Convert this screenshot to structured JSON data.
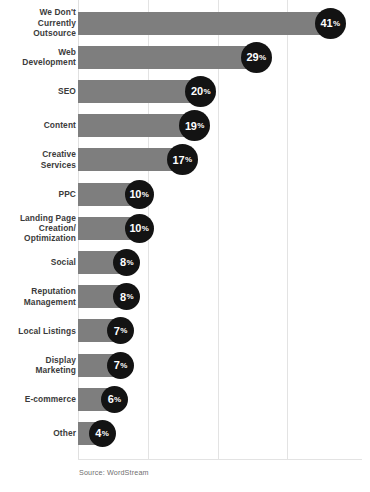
{
  "chart_data": {
    "type": "bar",
    "orientation": "horizontal",
    "title": "",
    "subtitle": "",
    "xlabel": "",
    "ylabel": "",
    "xlim": [
      0,
      45
    ],
    "grid": true,
    "gridline_values": [
      10,
      20,
      30
    ],
    "legend": "none",
    "value_suffix": "%",
    "source": "Source: WordStream",
    "categories": [
      "We Don't\nCurrently\nOutsource",
      "Web\nDevelopment",
      "SEO",
      "Content",
      "Creative\nServices",
      "PPC",
      "Landing Page\nCreation/\nOptimization",
      "Social",
      "Reputation\nManagement",
      "Local Listings",
      "Display\nMarketing",
      "E-commerce",
      "Other"
    ],
    "values": [
      41,
      29,
      20,
      19,
      17,
      10,
      10,
      8,
      8,
      7,
      7,
      6,
      4
    ],
    "value_labels": [
      "41%",
      "29%",
      "20%",
      "19%",
      "17%",
      "10%",
      "10%",
      "8%",
      "8%",
      "7%",
      "7%",
      "6%",
      "4%"
    ],
    "colors": {
      "bar": "#7e7e7e",
      "badge": "#131313",
      "badge_text": "#ffffff",
      "label_text": "#3b3b3b",
      "gridline": "#e3e3e3",
      "source_text": "#6f6f6f",
      "background": "#ffffff"
    }
  },
  "source": {
    "text": "Source: WordStream"
  }
}
